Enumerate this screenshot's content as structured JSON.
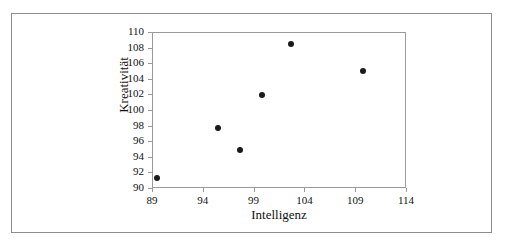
{
  "chart_data": {
    "type": "scatter",
    "title": "",
    "xlabel": "Intelligenz",
    "ylabel": "Kreativität",
    "xlim": [
      89,
      114
    ],
    "ylim": [
      90,
      110
    ],
    "xticks": [
      "89",
      "94",
      "99",
      "104",
      "109",
      "114"
    ],
    "xtick_values": [
      89,
      94,
      99,
      104,
      109,
      114
    ],
    "yticks": [
      "110",
      "108",
      "106",
      "104",
      "102",
      "100",
      "98",
      "96",
      "94",
      "92",
      "90"
    ],
    "ytick_values": [
      110,
      108,
      106,
      104,
      102,
      100,
      98,
      96,
      94,
      92,
      90
    ],
    "grid": false,
    "legend": false,
    "series": [
      {
        "name": "",
        "marker": "filled-circle",
        "color": "#1a1a1a",
        "points": [
          {
            "x": 89.4,
            "y": 91.4
          },
          {
            "x": 95.4,
            "y": 97.8
          },
          {
            "x": 97.6,
            "y": 95.0
          },
          {
            "x": 99.7,
            "y": 102.1
          },
          {
            "x": 102.6,
            "y": 108.6
          },
          {
            "x": 109.7,
            "y": 105.1
          }
        ]
      }
    ]
  },
  "figure": {
    "frame_color": "#8d8d8d",
    "axis_color": "#9a9a9a",
    "background": "#ffffff"
  }
}
